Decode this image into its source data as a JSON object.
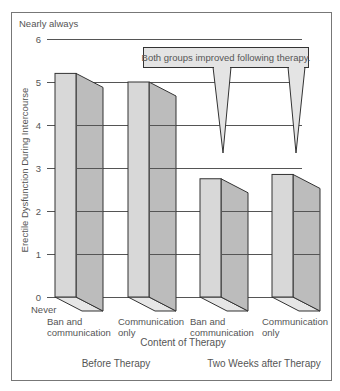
{
  "chart_data": {
    "type": "bar",
    "title": "",
    "ylabel": "Erectile Dysfunction During Intercourse",
    "xlabel": "Content of Therapy",
    "ylim": [
      0,
      6
    ],
    "yticks": [
      0,
      1,
      2,
      3,
      4,
      5,
      6
    ],
    "y_top_label": "Nearly always",
    "y_bottom_label": "Never",
    "grid": true,
    "categories": [
      "Ban and communication (Before Therapy)",
      "Communication only (Before Therapy)",
      "Ban and communication (Two Weeks after Therapy)",
      "Communication only (Two Weeks after Therapy)"
    ],
    "values": [
      5.2,
      5.0,
      2.75,
      2.85
    ],
    "bars": [
      {
        "line1": "Ban and",
        "line2": "communication",
        "value": 5.2
      },
      {
        "line1": "Communication",
        "line2": "only",
        "value": 5.0
      },
      {
        "line1": "Ban and",
        "line2": "communication",
        "value": 2.75
      },
      {
        "line1": "Communication",
        "line2": "only",
        "value": 2.85
      }
    ],
    "groups": [
      "Before Therapy",
      "Two Weeks after Therapy"
    ],
    "annotation": "Both groups improved following therapy.",
    "colors": {
      "front": "#d8d8d8",
      "side": "#bcbcbc",
      "bottom": "#e6e6e6",
      "callout": "#e4e4e4",
      "stroke": "#333333"
    }
  }
}
